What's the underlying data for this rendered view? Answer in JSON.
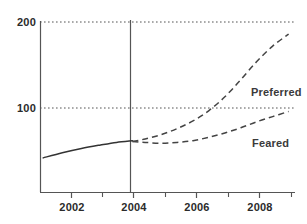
{
  "chart_data": {
    "type": "line",
    "title": "",
    "subtitle": "",
    "xlabel": "",
    "ylabel": "",
    "xlim": [
      2000.7,
      2008.7
    ],
    "ylim": [
      0,
      215
    ],
    "grid": true,
    "gridlines_y": [
      100,
      200
    ],
    "legend_position": "inline-annotation",
    "x_tick_labels": [
      "2002",
      "2004",
      "2006",
      "2008"
    ],
    "x_tick_values": [
      2002,
      2004,
      2006,
      2008
    ],
    "x_minor_tick_values": [
      2001,
      2003,
      2005,
      2007
    ],
    "y_tick_labels": [
      "100",
      "200"
    ],
    "y_tick_values": [
      100,
      200
    ],
    "divider_x": 2003.6,
    "series": [
      {
        "name": "Historical",
        "style": "solid",
        "color": "#333333",
        "x": [
          2000.8,
          2001.4,
          2002.0,
          2002.6,
          2003.1,
          2003.6
        ],
        "values": [
          42,
          48,
          53,
          57,
          60,
          62
        ]
      },
      {
        "name": "Preferred",
        "style": "dashed",
        "color": "#444444",
        "label": "Preferred",
        "x": [
          2003.6,
          2004.0,
          2004.5,
          2005.0,
          2005.5,
          2006.0,
          2006.5,
          2007.0,
          2007.5,
          2008.0,
          2008.5
        ],
        "values": [
          61,
          64,
          69,
          76,
          85,
          97,
          113,
          133,
          154,
          172,
          186
        ]
      },
      {
        "name": "Feared",
        "style": "dashed",
        "color": "#444444",
        "label": "Feared",
        "x": [
          2003.6,
          2004.0,
          2004.5,
          2005.0,
          2005.5,
          2006.0,
          2006.5,
          2007.0,
          2007.5,
          2008.0,
          2008.5
        ],
        "values": [
          61,
          60,
          59,
          60,
          62,
          66,
          71,
          77,
          84,
          90,
          96
        ]
      }
    ],
    "annotations": [
      {
        "text": "Preferred",
        "x": 2007.0,
        "y": 122
      },
      {
        "text": "Feared",
        "x": 2007.2,
        "y": 62
      }
    ]
  }
}
